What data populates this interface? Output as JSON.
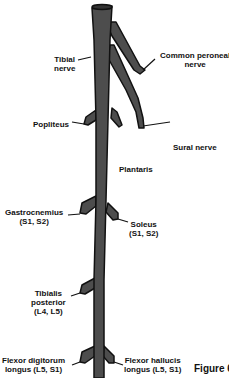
{
  "diagram": {
    "figure_label": "Figure 6",
    "colors": {
      "nerve_fill": "#4d4d4d",
      "nerve_outline": "#111111",
      "text": "#111111",
      "background": "#ffffff"
    },
    "labels": {
      "tibial_nerve": {
        "line1": "Tibial",
        "line2": "nerve"
      },
      "common_peroneal": {
        "line1": "Common peroneal",
        "line2": "nerve"
      },
      "popliteus": {
        "line1": "Popliteus"
      },
      "sural_nerve": {
        "line1": "Sural nerve"
      },
      "plantaris": {
        "line1": "Plantaris"
      },
      "gastrocnemius": {
        "line1": "Gastrocnemius",
        "line2": "(S1, S2)"
      },
      "soleus": {
        "line1": "Soleus",
        "line2": "(S1, S2)"
      },
      "tibialis_posterior": {
        "line1": "Tibialis",
        "line2": "posterior",
        "line3": "(L4, L5)"
      },
      "flexor_digitorum": {
        "line1": "Flexor digitorum",
        "line2": "longus (L5, S1)"
      },
      "flexor_hallucis": {
        "line1": "Flexor hallucis",
        "line2": "longus (L5, S1)"
      }
    }
  }
}
